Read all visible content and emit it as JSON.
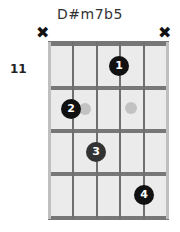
{
  "chord": {
    "name": "D#m7b5",
    "start_fret": "11",
    "muted_strings": [
      {
        "string": 6,
        "symbol": "✖"
      },
      {
        "string": 1,
        "symbol": "✖"
      }
    ],
    "fingers": [
      {
        "label": "1",
        "string": 3,
        "fret": 1
      },
      {
        "label": "2",
        "string": 5,
        "fret": 2
      },
      {
        "label": "3",
        "string": 4,
        "fret": 3
      },
      {
        "label": "4",
        "string": 2,
        "fret": 4
      }
    ],
    "ghost_dots": [
      {
        "string": 5,
        "fret": 2
      },
      {
        "string": 3,
        "fret": 2
      }
    ],
    "colors": {
      "finger": "#111111",
      "ghost": "#c2c2c2",
      "board": "#ebebeb",
      "fret": "#777777"
    }
  }
}
